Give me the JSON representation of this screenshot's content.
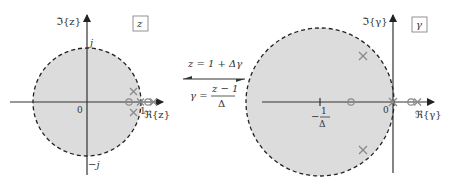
{
  "left_plane": {
    "imag_axis_label": "ℑ{z}",
    "real_axis_label": "ℜ{z}",
    "plane_tag": "z",
    "tick_top": "j",
    "tick_bottom": "−j",
    "origin": "0",
    "one": "1"
  },
  "mapping": {
    "forward": "z = 1 + Δγ",
    "inverse_lhs": "γ =",
    "inverse_num": "z − 1",
    "inverse_den": "Δ"
  },
  "right_plane": {
    "imag_axis_label": "ℑ{γ}",
    "real_axis_label": "ℜ{γ}",
    "plane_tag": "γ",
    "origin": "0",
    "tick_num": "1",
    "tick_minus": "−",
    "tick_den": "Δ"
  },
  "colors": {
    "region_fill": "#dcdcdc",
    "axis": "#333333",
    "marker": "#8a8a8a"
  }
}
